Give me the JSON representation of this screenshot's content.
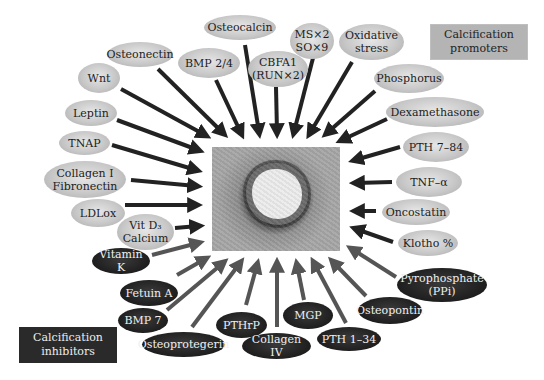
{
  "legend": {
    "promoters_label": "Calcification\npromoters",
    "inhibitors_label": "Calcification\ninhibitors"
  },
  "colors": {
    "promoter_fill": "#c4c4c4",
    "promoter_arrow": "#222222",
    "inhibitor_fill": "#1e1e1e",
    "inhibitor_arrow": "#555555",
    "background": "#ffffff"
  },
  "center": {
    "description": "Histological cross-section of calcified artery"
  },
  "promoters": [
    {
      "label": "Osteocalcin"
    },
    {
      "label": "MS×2\nSO×9"
    },
    {
      "label": "Oxidative\nstress"
    },
    {
      "label": "CBFA1\n(RUN×2)"
    },
    {
      "label": "BMP 2/4"
    },
    {
      "label": "Osteonectin"
    },
    {
      "label": "Wnt"
    },
    {
      "label": "Leptin"
    },
    {
      "label": "TNAP"
    },
    {
      "label": "Collagen I\nFibronectin"
    },
    {
      "label": "LDLox"
    },
    {
      "label": "Vit D₃\nCalcium"
    },
    {
      "label": "Phosphorus"
    },
    {
      "label": "Dexamethasone"
    },
    {
      "label": "PTH 7–84"
    },
    {
      "label": "TNF–α"
    },
    {
      "label": "Oncostatin"
    },
    {
      "label": "Klotho %"
    }
  ],
  "inhibitors": [
    {
      "label": "Vitamin K"
    },
    {
      "label": "Fetuin A"
    },
    {
      "label": "BMP 7"
    },
    {
      "label": "Osteoprotegerin"
    },
    {
      "label": "PTHrP"
    },
    {
      "label": "Collagen IV"
    },
    {
      "label": "MGP"
    },
    {
      "label": "PTH 1–34"
    },
    {
      "label": "Osteopontin"
    },
    {
      "label": "Pyrophosphate\n(PPi)"
    }
  ]
}
